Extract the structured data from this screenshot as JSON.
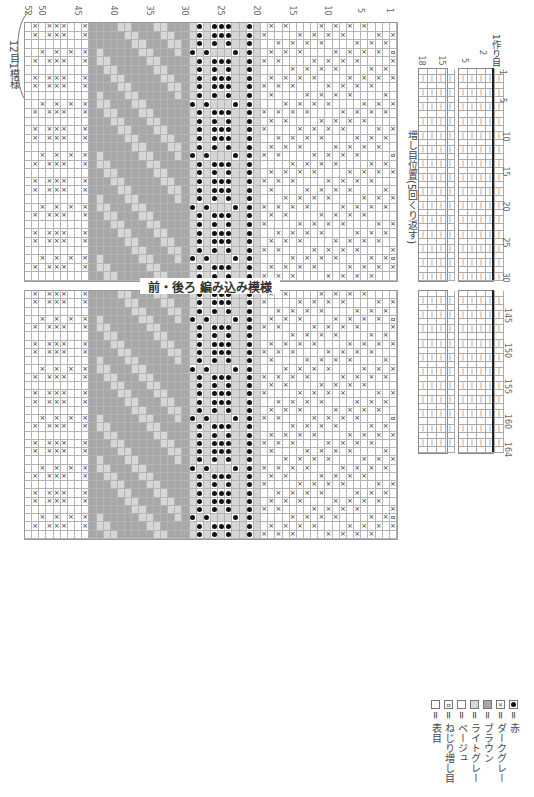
{
  "title": "前・後ろ 編み込み模様",
  "repeat_label": "12目1模様",
  "increase_label": "増し目位置(5回くり返す)",
  "cast_on_label": "1作り目",
  "row_labels_top": [
    "52",
    "50",
    "45",
    "40",
    "35",
    "30",
    "25",
    "20",
    "15",
    "10",
    "5",
    "1"
  ],
  "stitch_labels_right_upper": [
    "1",
    "5",
    "10",
    "15",
    "20",
    "25",
    "30"
  ],
  "stitch_labels_right_lower": [
    "145",
    "150",
    "155",
    "160",
    "164"
  ],
  "side_chart_labels": [
    "18",
    "15",
    "5",
    "2"
  ],
  "legend": [
    {
      "symbol": "□=□",
      "label": "表目"
    },
    {
      "symbol": "ߛ",
      "label": "ねじり増し目"
    },
    {
      "symbol": "□",
      "label": "ベージュ",
      "color": "#ffffff"
    },
    {
      "symbol": "□",
      "label": "ライトグレー",
      "color": "#d6d6d6"
    },
    {
      "symbol": "■",
      "label": "ブラウン",
      "color": "#a8a8a8"
    },
    {
      "symbol": "⊠",
      "label": "ダークグレー"
    },
    {
      "symbol": "●",
      "label": "赤"
    }
  ],
  "colors": {
    "beige": "#ffffff",
    "light_gray": "#d6d6d6",
    "brown": "#a8a8a8",
    "dark_gray_symbol": "#333333",
    "red_symbol": "#111111"
  },
  "chart": {
    "rows": 52,
    "upper_stitches": 30,
    "lower_stitches": 30,
    "band_order_by_row_descending": [
      "dark-gray-x band (52-44)",
      "brown/light-gray band (43-30)",
      "red-dot band (29-20)",
      "dark-gray-x band (19-1)"
    ]
  }
}
